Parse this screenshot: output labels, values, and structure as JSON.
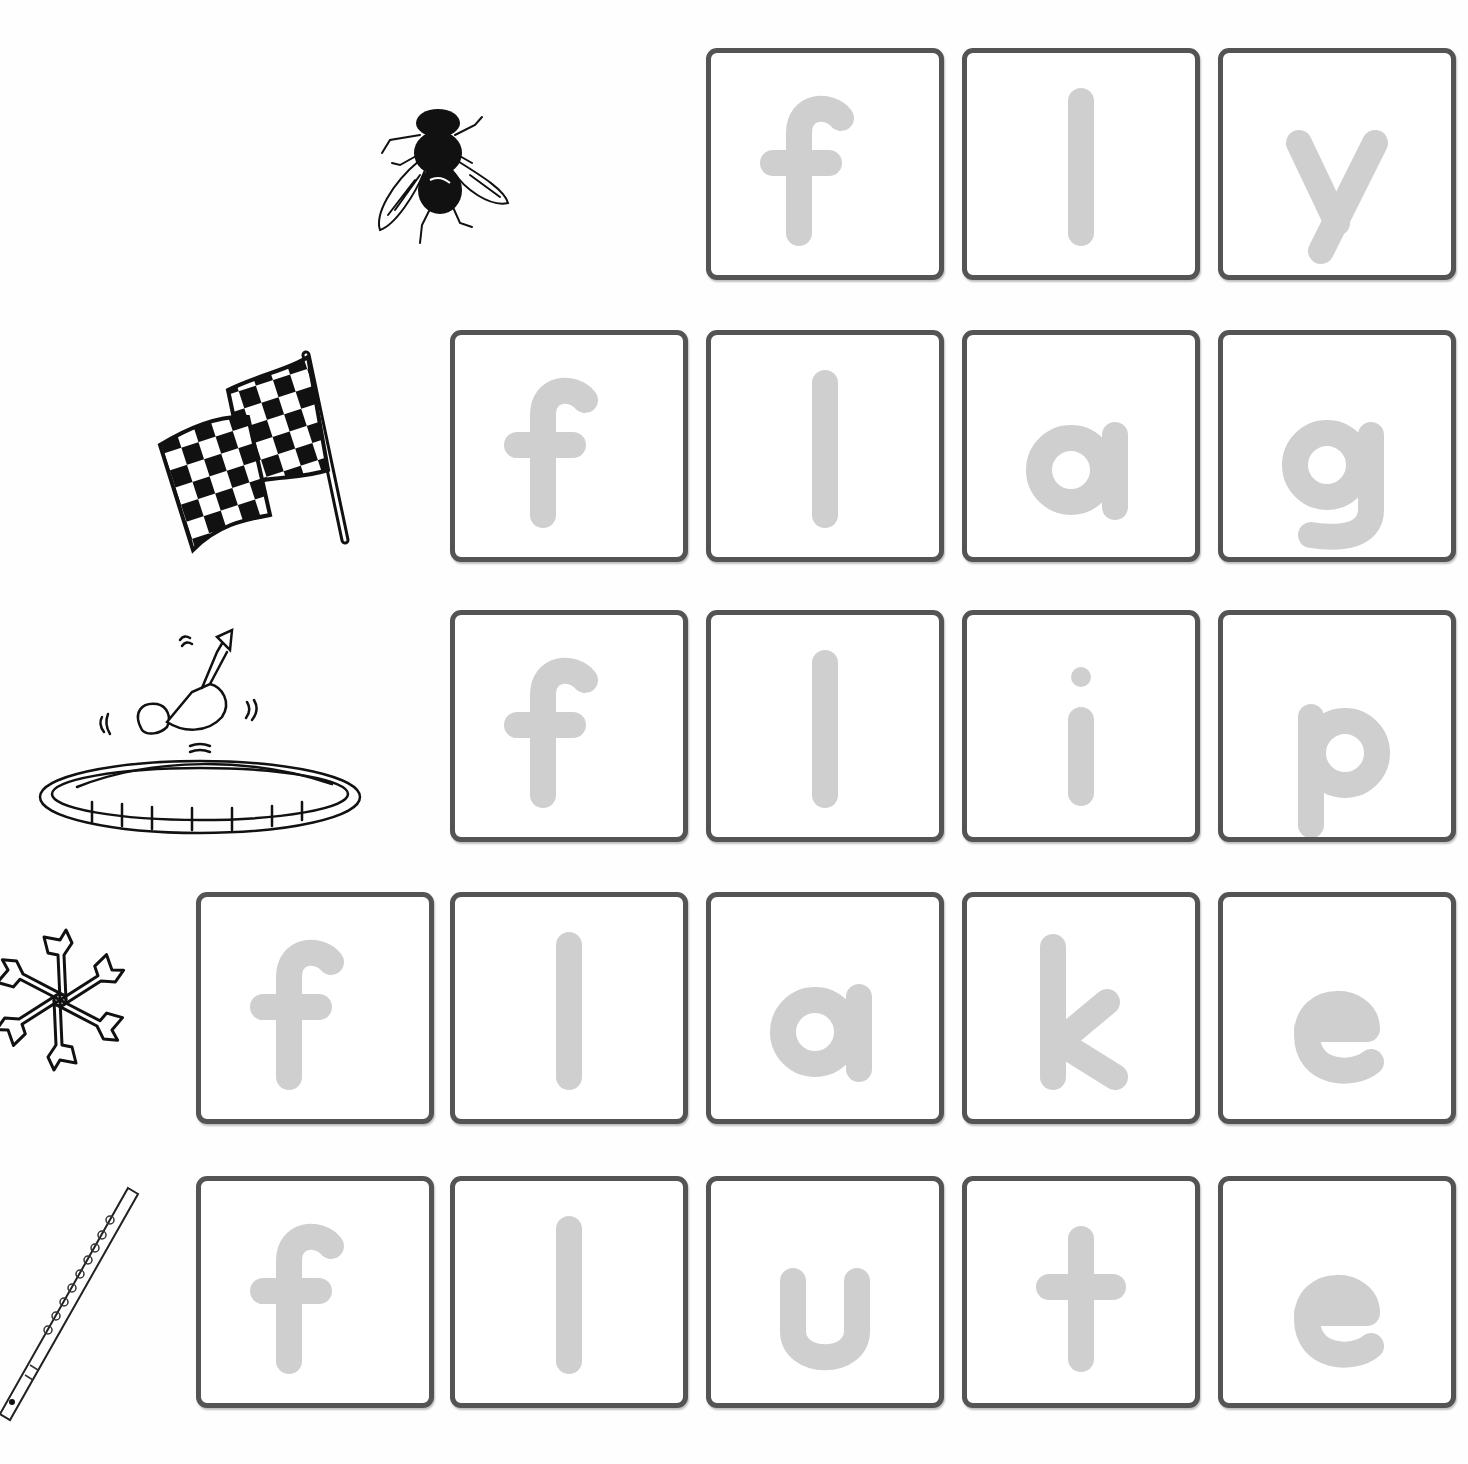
{
  "worksheet": {
    "letter_color": "#cfcfcf",
    "border_color": "#545454",
    "rows": [
      {
        "word": "fly",
        "picture": "fly-insect",
        "letters": [
          "f",
          "l",
          "y"
        ]
      },
      {
        "word": "flag",
        "picture": "checkered-flag",
        "letters": [
          "f",
          "l",
          "a",
          "g"
        ]
      },
      {
        "word": "flip",
        "picture": "trampoline-flip",
        "letters": [
          "f",
          "l",
          "i",
          "p"
        ]
      },
      {
        "word": "flake",
        "picture": "snowflake",
        "letters": [
          "f",
          "l",
          "a",
          "k",
          "e"
        ]
      },
      {
        "word": "flute",
        "picture": "flute",
        "letters": [
          "f",
          "l",
          "u",
          "t",
          "e"
        ]
      }
    ]
  }
}
